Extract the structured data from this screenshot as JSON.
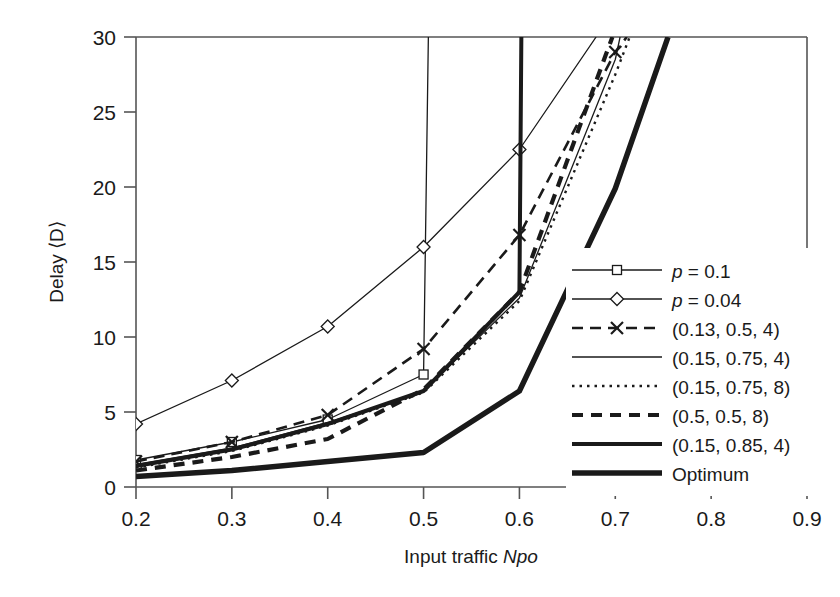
{
  "chart_data": {
    "type": "line",
    "title": "",
    "xlabel": "Input traffic Npo",
    "ylabel": "Delay ⟨D⟩",
    "xlim": [
      0.2,
      0.9
    ],
    "ylim": [
      0,
      30
    ],
    "xticks": [
      "0.2",
      "0.3",
      "0.4",
      "0.5",
      "0.6",
      "0.7",
      "0.8",
      "0.9"
    ],
    "yticks": [
      "0",
      "5",
      "10",
      "15",
      "20",
      "25",
      "30"
    ],
    "grid": false,
    "legend_position": "right-inside",
    "series": [
      {
        "name": "p = 0.1",
        "style": "solid-thin-square",
        "marker": "square",
        "x": [
          0.2,
          0.3,
          0.4,
          0.5,
          0.505
        ],
        "y": [
          1.8,
          3.0,
          4.5,
          7.5,
          30.0
        ]
      },
      {
        "name": "p = 0.04",
        "style": "solid-thin-diamond",
        "marker": "diamond",
        "x": [
          0.2,
          0.3,
          0.4,
          0.5,
          0.6,
          0.68
        ],
        "y": [
          4.2,
          7.1,
          10.7,
          16.0,
          22.5,
          30.0
        ]
      },
      {
        "name": "(0.13, 0.5, 4)",
        "style": "dashed-x",
        "marker": "x",
        "x": [
          0.2,
          0.3,
          0.4,
          0.5,
          0.6,
          0.7,
          0.712
        ],
        "y": [
          1.7,
          3.0,
          4.8,
          9.2,
          16.8,
          29.0,
          30.0
        ]
      },
      {
        "name": "(0.15, 0.75, 4)",
        "style": "solid-thin",
        "marker": "none",
        "x": [
          0.2,
          0.3,
          0.4,
          0.5,
          0.6,
          0.7,
          0.705
        ],
        "y": [
          1.5,
          2.6,
          4.3,
          6.4,
          12.6,
          28.5,
          30.0
        ]
      },
      {
        "name": "(0.15, 0.75, 8)",
        "style": "dotted",
        "marker": "none",
        "x": [
          0.2,
          0.3,
          0.4,
          0.5,
          0.6,
          0.7,
          0.715
        ],
        "y": [
          1.3,
          2.4,
          4.1,
          6.3,
          12.4,
          27.5,
          30.0
        ]
      },
      {
        "name": "(0.5, 0.5, 8)",
        "style": "thick-dashed",
        "marker": "none",
        "x": [
          0.2,
          0.3,
          0.4,
          0.5,
          0.6,
          0.69,
          0.697
        ],
        "y": [
          1.1,
          2.0,
          3.2,
          6.5,
          13.0,
          28.8,
          30.0
        ]
      },
      {
        "name": "(0.15, 0.85, 4)",
        "style": "thick-solid",
        "marker": "none",
        "x": [
          0.2,
          0.3,
          0.4,
          0.5,
          0.6,
          0.602
        ],
        "y": [
          1.4,
          2.5,
          4.2,
          6.4,
          13.0,
          30.0
        ]
      },
      {
        "name": "Optimum",
        "style": "extra-thick-solid",
        "marker": "none",
        "x": [
          0.2,
          0.3,
          0.4,
          0.5,
          0.6,
          0.7,
          0.755
        ],
        "y": [
          0.7,
          1.1,
          1.7,
          2.3,
          6.4,
          19.9,
          30.0
        ]
      }
    ]
  },
  "legend": {
    "items": [
      {
        "label": "p = 0.1",
        "italic_prefix": "p",
        "rest": " = 0.1",
        "style": "solid-thin-square"
      },
      {
        "label": "p = 0.04",
        "italic_prefix": "p",
        "rest": " = 0.04",
        "style": "solid-thin-diamond"
      },
      {
        "label": "(0.13, 0.5, 4)",
        "italic_prefix": "",
        "rest": "(0.13, 0.5, 4)",
        "style": "dashed-x"
      },
      {
        "label": "(0.15, 0.75, 4)",
        "italic_prefix": "",
        "rest": "(0.15, 0.75, 4)",
        "style": "solid-thin"
      },
      {
        "label": "(0.15, 0.75, 8)",
        "italic_prefix": "",
        "rest": "(0.15, 0.75, 8)",
        "style": "dotted"
      },
      {
        "label": "(0.5, 0.5, 8)",
        "italic_prefix": "",
        "rest": "(0.5, 0.5, 8)",
        "style": "thick-dashed"
      },
      {
        "label": "(0.15, 0.85, 4)",
        "italic_prefix": "",
        "rest": "(0.15, 0.85, 4)",
        "style": "thick-solid"
      },
      {
        "label": "Optimum",
        "italic_prefix": "",
        "rest": "Optimum",
        "style": "extra-thick-solid"
      }
    ]
  },
  "axes": {
    "x_title_plain": "Input traffic ",
    "x_title_italic": "Npo",
    "y_title": "Delay ⟨D⟩"
  },
  "colors": {
    "line": "#1a1a1a",
    "axis": "#4a4a4a",
    "background": "#ffffff"
  }
}
